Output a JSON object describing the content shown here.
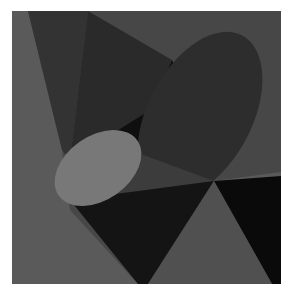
{
  "artwork": {
    "title": "",
    "background": "#ffffff",
    "frame": {
      "x": 12,
      "y": 11,
      "width": 269,
      "height": 273
    },
    "colors": {
      "field": "#4a4a4a",
      "mid_gray": "#3a3a3a",
      "dark_gray": "#2e2e2e",
      "darker": "#262626",
      "black": "#0f0f0f",
      "light_gray": "#707070",
      "light_triangle": "#555555",
      "big_ellipse": "#2c2c2c",
      "small_ellipse": "#7a7a7a"
    },
    "shapes": [
      {
        "name": "background-field",
        "type": "rect"
      },
      {
        "name": "left-light-wedge",
        "type": "polygon"
      },
      {
        "name": "top-dark-triangle",
        "type": "polygon"
      },
      {
        "name": "central-black-wedge",
        "type": "polygon"
      },
      {
        "name": "large-dark-ellipse",
        "type": "ellipse"
      },
      {
        "name": "small-light-ellipse",
        "type": "ellipse"
      },
      {
        "name": "bottom-dark-band",
        "type": "polygon"
      },
      {
        "name": "bottom-right-black-triangle",
        "type": "polygon"
      },
      {
        "name": "bottom-center-gray-triangle",
        "type": "polygon"
      }
    ]
  }
}
